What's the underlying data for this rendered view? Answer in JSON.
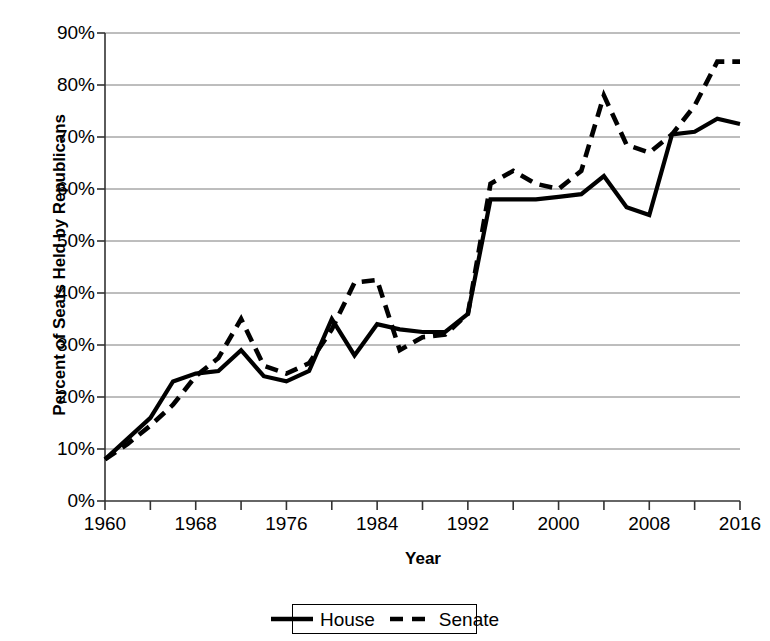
{
  "chart_data": {
    "type": "line",
    "title": "",
    "xlabel": "Year",
    "ylabel": "Percent of Seats Held by Republicans",
    "xlim": [
      1960,
      2016
    ],
    "ylim": [
      0,
      90
    ],
    "grid": true,
    "legend_position": "bottom",
    "x_ticks": [
      "1960",
      "1968",
      "1976",
      "1984",
      "1992",
      "2000",
      "2008",
      "2016"
    ],
    "x_tick_values": [
      1960,
      1968,
      1976,
      1984,
      1992,
      2000,
      2008,
      2016
    ],
    "y_ticks": [
      "0%",
      "10%",
      "20%",
      "30%",
      "40%",
      "50%",
      "60%",
      "70%",
      "80%",
      "90%"
    ],
    "y_tick_values": [
      0,
      10,
      20,
      30,
      40,
      50,
      60,
      70,
      80,
      90
    ],
    "x": [
      1960,
      1962,
      1964,
      1966,
      1968,
      1970,
      1972,
      1974,
      1976,
      1978,
      1980,
      1982,
      1984,
      1986,
      1988,
      1990,
      1992,
      1994,
      1996,
      1998,
      2000,
      2002,
      2004,
      2006,
      2008,
      2010,
      2012,
      2014,
      2016
    ],
    "series": [
      {
        "name": "House",
        "style": "solid",
        "color": "#000000",
        "values": [
          8,
          12,
          16,
          23,
          24.5,
          25,
          29,
          24,
          23,
          25,
          35,
          28,
          34,
          33,
          32.5,
          32.5,
          36,
          58,
          58,
          58,
          58.5,
          59,
          62.5,
          56.5,
          55,
          70.5,
          71,
          73.5,
          72.5
        ]
      },
      {
        "name": "Senate",
        "style": "dashed",
        "color": "#000000",
        "values": [
          8,
          11,
          14.5,
          18.5,
          24,
          27.5,
          35,
          26,
          24.5,
          26.5,
          33,
          42,
          42.5,
          29,
          31.5,
          32,
          36,
          61,
          63.5,
          61,
          60,
          63.5,
          78,
          68.5,
          67,
          70.5,
          76,
          84.5,
          84.5
        ]
      }
    ]
  },
  "legend": {
    "items": [
      {
        "label": "House",
        "style": "solid"
      },
      {
        "label": "Senate",
        "style": "dashed"
      }
    ]
  }
}
